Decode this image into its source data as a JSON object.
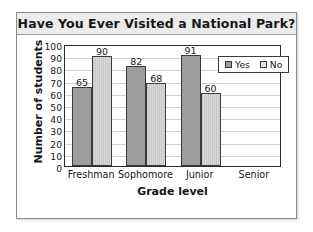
{
  "chart_data": {
    "type": "bar",
    "title": "Have You Ever Visited a National Park?",
    "xlabel": "Grade level",
    "ylabel": "Number of students",
    "categories": [
      "Freshman",
      "Sophomore",
      "Junior",
      "Senior"
    ],
    "series": [
      {
        "name": "Yes",
        "values": [
          65,
          82,
          91,
          null
        ],
        "color": "#9d9d9d"
      },
      {
        "name": "No",
        "values": [
          90,
          68,
          60,
          null
        ],
        "color": "#d4d4d4"
      }
    ],
    "ylim": [
      0,
      100
    ],
    "ytick_step": 10,
    "yticks": [
      0,
      10,
      20,
      30,
      40,
      50,
      60,
      70,
      80,
      90,
      100
    ],
    "grid": true,
    "legend_position": "upper-right",
    "data_labels": [
      "65",
      "90",
      "82",
      "68",
      "91",
      "60"
    ]
  },
  "legend": {
    "items": [
      {
        "label": "Yes",
        "swatch": "yes"
      },
      {
        "label": "No",
        "swatch": "no"
      }
    ]
  }
}
